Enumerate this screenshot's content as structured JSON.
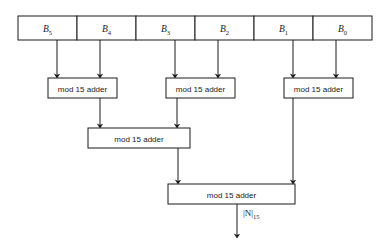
{
  "figure": {
    "type": "block-diagram",
    "colors": {
      "background": "#ffffff",
      "line": "#1a1a1a",
      "box_fill": "#ffffff",
      "text": "#1a1a1a"
    }
  },
  "register": {
    "name": "input-register",
    "cells": [
      {
        "base": "B",
        "subscript": "5"
      },
      {
        "base": "B",
        "subscript": "4"
      },
      {
        "base": "B",
        "subscript": "3"
      },
      {
        "base": "B",
        "subscript": "2"
      },
      {
        "base": "B",
        "subscript": "1"
      },
      {
        "base": "B",
        "subscript": "0"
      }
    ]
  },
  "adders": {
    "label": "mod 15 adder",
    "level1": [
      {
        "id": "adder-1",
        "inputs": [
          "B5",
          "B4"
        ]
      },
      {
        "id": "adder-2",
        "inputs": [
          "B3",
          "B2"
        ]
      },
      {
        "id": "adder-3",
        "inputs": [
          "B1",
          "B0"
        ]
      }
    ],
    "level2": [
      {
        "id": "adder-4",
        "inputs": [
          "adder-1",
          "adder-2"
        ]
      }
    ],
    "level3": [
      {
        "id": "adder-5",
        "inputs": [
          "adder-4",
          "adder-3"
        ]
      }
    ]
  },
  "output": {
    "name": "result",
    "base": "|N|",
    "subscript": "15"
  }
}
